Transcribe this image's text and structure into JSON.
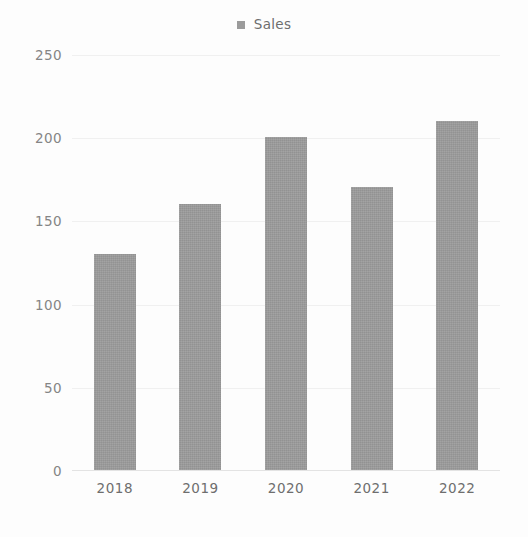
{
  "chart_data": {
    "type": "bar",
    "title": "",
    "subtitle": "",
    "xlabel": "",
    "ylabel": "",
    "categories": [
      "2018",
      "2019",
      "2020",
      "2021",
      "2022"
    ],
    "series": [
      {
        "name": "Sales",
        "values": [
          130,
          160,
          200,
          170,
          210
        ],
        "color": "#9b9b9b"
      }
    ],
    "ylim": [
      0,
      250
    ],
    "yticks": [
      0,
      50,
      100,
      150,
      200,
      250
    ],
    "ytick_labels": [
      "0",
      "50",
      "100",
      "150",
      "200",
      "250"
    ],
    "grid": true,
    "grid_axis": "y",
    "legend": {
      "visible": true,
      "position": "top-center",
      "entries": [
        {
          "label": "Sales",
          "marker": "square",
          "color": "#9b9b9b"
        }
      ]
    },
    "background_color": "#fdfdfd",
    "gridline_color": "#f0f0f0",
    "axis_color": "#e3e3e3",
    "tick_label_color": "#858585"
  }
}
